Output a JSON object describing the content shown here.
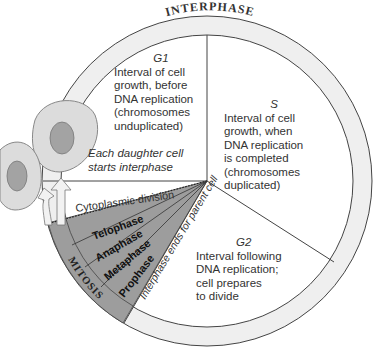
{
  "title": "INTERPHASE",
  "colors": {
    "ring": "#efefef",
    "mitosis_fill": "#9d9d9d",
    "line": "#444444",
    "text": "#333333",
    "cell_fill": "#d8d8d8",
    "nucleus_fill": "#a0a0a0"
  },
  "phases": {
    "g1": {
      "name": "G1",
      "lines": [
        "Interval of cell",
        "growth, before",
        "DNA replication",
        "(chromosomes",
        "unduplicated)"
      ]
    },
    "s": {
      "name": "S",
      "lines": [
        "Interval of cell",
        "growth, when",
        "DNA replication",
        "is completed",
        "(chromosomes",
        "duplicated)"
      ]
    },
    "g2": {
      "name": "G2",
      "lines": [
        "Interval following",
        "DNA replication;",
        "cell prepares",
        "to divide"
      ]
    }
  },
  "mitosis": {
    "label": "MITOSIS",
    "stages": [
      "Telophase",
      "Anaphase",
      "Metaphase",
      "Prophase"
    ]
  },
  "cytoplasmic_division": "Cytoplasmic division",
  "daughter_note": [
    "Each daughter cell",
    "starts interphase"
  ],
  "interphase_ends": "Interphase ends for parent cell"
}
